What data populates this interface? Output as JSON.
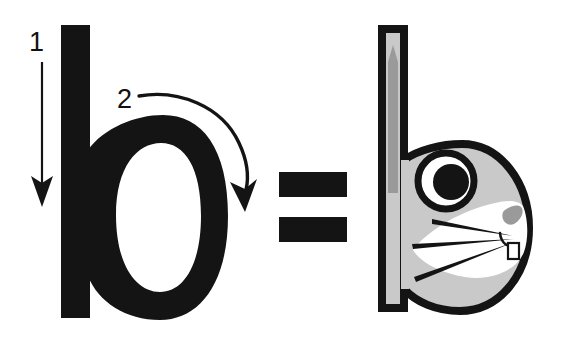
{
  "illustration": {
    "title": "Letter b stroke order mnemonic equals rabbit head",
    "background_color": "#ffffff",
    "ink_color": "#141414"
  },
  "left_diagram": {
    "name": "letter-b-with-stroke-order",
    "letter": "b",
    "letter_color": "#141414",
    "strokes": [
      {
        "number": "1",
        "label_x": 38,
        "label_y": 51,
        "direction": "down",
        "description": "vertical downstroke along the stem"
      },
      {
        "number": "2",
        "label_x": 126,
        "label_y": 108,
        "direction": "clockwise-curve",
        "description": "curved stroke forming the bowl"
      }
    ]
  },
  "equals_sign": {
    "name": "equals-sign",
    "symbol": "=",
    "color": "#141414",
    "bars": 2
  },
  "right_diagram": {
    "name": "rabbit-head-letter-b",
    "letter": "b",
    "mnemonic": "rabbit",
    "colors": {
      "outline": "#141414",
      "head_fill": "#c9c9c9",
      "ear_inner": "#9a9a9a",
      "muzzle": "#ffffff",
      "nose": "#9a9a9a",
      "eye_white": "#ffffff",
      "pupil": "#141414",
      "tooth": "#ffffff"
    },
    "parts": [
      {
        "name": "ear",
        "label": "ear (letter stem)"
      },
      {
        "name": "head",
        "label": "head (letter bowl)"
      },
      {
        "name": "eye",
        "label": "eye"
      },
      {
        "name": "muzzle",
        "label": "muzzle"
      },
      {
        "name": "nose",
        "label": "nose"
      },
      {
        "name": "whiskers",
        "label": "whiskers",
        "count": 3
      },
      {
        "name": "tooth",
        "label": "tooth"
      }
    ]
  }
}
